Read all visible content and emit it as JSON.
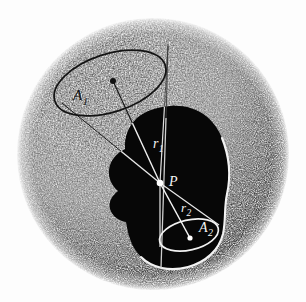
{
  "figure": {
    "domain": "diagram",
    "kind": "scientific-illustration",
    "background_color": "#fdfdfd"
  },
  "sphere": {
    "name": "outer-sphere",
    "center_x": 153,
    "center_y": 154,
    "radius": 136,
    "shading": "stipple",
    "light_from": "upper-left",
    "light_color": "#ffffff",
    "shadow_color": "#111111"
  },
  "dark_region": {
    "name": "dark-blob",
    "fill_color": "#080808",
    "outline_color": "#ffffff",
    "outline_width": 1.6
  },
  "point_p": {
    "label": "P",
    "x": 169,
    "y": 180,
    "marker_x": 160,
    "marker_y": 183,
    "marker_color": "#ffffff",
    "marker_radius": 3.2
  },
  "area_1": {
    "label": "A",
    "subscript": "1",
    "label_x": 73,
    "label_y": 100,
    "center_x": 113,
    "center_y": 81,
    "ellipse_cx": 110,
    "ellipse_cy": 83,
    "ellipse_rx": 58,
    "ellipse_ry": 29,
    "ellipse_rotation": -18,
    "stroke_color": "#111111",
    "dot_color": "#111111",
    "dot_radius": 3.0
  },
  "area_2": {
    "label": "A",
    "subscript": "2",
    "label_x": 199,
    "label_y": 232,
    "center_x": 190,
    "center_y": 238,
    "ellipse_cx": 189,
    "ellipse_cy": 235,
    "ellipse_rx": 30,
    "ellipse_ry": 15,
    "ellipse_rotation": -13,
    "stroke_color": "#ffffff",
    "dot_color": "#ffffff",
    "dot_radius": 2.6
  },
  "radius_1": {
    "label": "r",
    "subscript": "1",
    "label_x": 153,
    "label_y": 148,
    "from_x": 113,
    "from_y": 81,
    "to_x": 160,
    "to_y": 183,
    "color_light": "#111111",
    "color_dark": "#ffffff"
  },
  "radius_2": {
    "label": "r",
    "subscript": "2",
    "label_x": 181,
    "label_y": 210,
    "from_x": 160,
    "from_y": 183,
    "to_x": 190,
    "to_y": 238,
    "color": "#ffffff"
  },
  "cone_lines": {
    "name": "cone-edges",
    "upper_left_from_x": 62,
    "upper_left_from_y": 103,
    "upper_right_from_x": 168,
    "upper_right_from_y": 46,
    "lower_left_from_x": 160,
    "lower_left_from_y": 247,
    "lower_right_from_x": 219,
    "lower_right_from_y": 224,
    "color_light": "#111111",
    "color_dark": "#ffffff"
  },
  "labels": [
    {
      "id": "A1",
      "text": "A",
      "sub": "1"
    },
    {
      "id": "A2",
      "text": "A",
      "sub": "2"
    },
    {
      "id": "r1",
      "text": "r",
      "sub": "1"
    },
    {
      "id": "r2",
      "text": "r",
      "sub": "2"
    },
    {
      "id": "P",
      "text": "P",
      "sub": ""
    }
  ]
}
